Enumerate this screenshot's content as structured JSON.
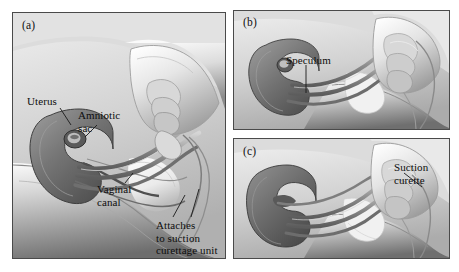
{
  "figure": {
    "type": "medical-illustration",
    "style": "grayscale pen-and-ink / airbrush anatomical drawing",
    "panel_count": 3
  },
  "panels": [
    {
      "id": "a",
      "label": "(a)",
      "position": "left, full height",
      "callouts": [
        {
          "id": "uterus",
          "text": "Uterus",
          "lines": [
            "Uterus"
          ]
        },
        {
          "id": "amniotic",
          "text": "Amniotic sac",
          "lines": [
            "Amniotic",
            "sac"
          ]
        },
        {
          "id": "vaginal",
          "text": "Vaginal canal",
          "lines": [
            "Vaginal",
            "canal"
          ]
        },
        {
          "id": "attaches",
          "text": "Attaches to suction curettage unit",
          "lines": [
            "Attaches",
            "to suction",
            "curettage unit"
          ]
        }
      ]
    },
    {
      "id": "b",
      "label": "(b)",
      "position": "top right",
      "callouts": [
        {
          "id": "speculum",
          "text": "Speculum",
          "lines": [
            "Speculum"
          ]
        }
      ]
    },
    {
      "id": "c",
      "label": "(c)",
      "position": "bottom right",
      "callouts": [
        {
          "id": "curette",
          "text": "Suction curette",
          "lines": [
            "Suction",
            "curette"
          ]
        }
      ]
    }
  ],
  "callout_text": {
    "uterus": "Uterus",
    "amniotic_l1": "Amniotic",
    "amniotic_l2": "sac",
    "vaginal_l1": "Vaginal",
    "vaginal_l2": "canal",
    "attaches_l1": "Attaches",
    "attaches_l2": "to suction",
    "attaches_l3": "curettage unit",
    "speculum": "Speculum",
    "curette_l1": "Suction",
    "curette_l2": "curette"
  },
  "colors": {
    "page_background": "#ffffff",
    "panel_background": "#d9d9d9",
    "panel_border": "#4a4a4a",
    "text": "#0d0d0d",
    "organ_dark": "#6e6e6e",
    "organ_darker": "#4f4f4f",
    "skin_light": "#f2f2f2",
    "skin_mid": "#b8b8b8",
    "skin_shadow": "#7a7a7a",
    "instrument": "#8d8d8d"
  }
}
